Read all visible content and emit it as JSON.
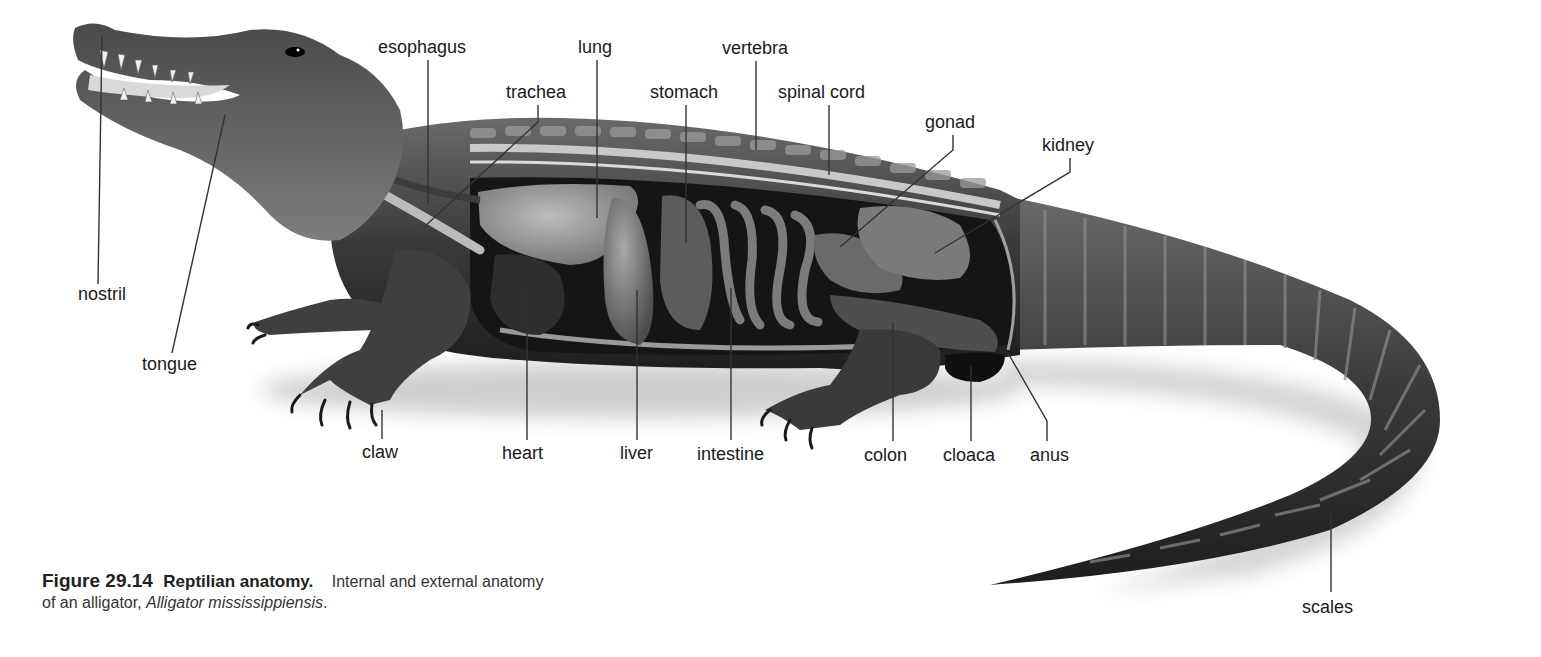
{
  "figure": {
    "number": "Figure 29.14",
    "title": "Reptilian anatomy.",
    "caption_text": "Internal and external anatomy",
    "caption_line2_prefix": "of an alligator, ",
    "species": "Alligator mississippiensis",
    "caption_line2_suffix": "."
  },
  "labels": [
    {
      "id": "nostril",
      "text": "nostril",
      "x": 78,
      "y": 284,
      "line": [
        [
          98,
          284
        ],
        [
          102,
          35
        ]
      ]
    },
    {
      "id": "tongue",
      "text": "tongue",
      "x": 142,
      "y": 354,
      "line": [
        [
          172,
          353
        ],
        [
          225,
          115
        ]
      ]
    },
    {
      "id": "esophagus",
      "text": "esophagus",
      "x": 378,
      "y": 37,
      "line": [
        [
          428,
          60
        ],
        [
          428,
          203
        ]
      ]
    },
    {
      "id": "trachea",
      "text": "trachea",
      "x": 506,
      "y": 82,
      "line": [
        [
          538,
          105
        ],
        [
          538,
          122
        ],
        [
          423,
          228
        ]
      ]
    },
    {
      "id": "lung",
      "text": "lung",
      "x": 578,
      "y": 37,
      "line": [
        [
          597,
          60
        ],
        [
          597,
          218
        ]
      ]
    },
    {
      "id": "stomach",
      "text": "stomach",
      "x": 650,
      "y": 82,
      "line": [
        [
          686,
          105
        ],
        [
          686,
          243
        ]
      ]
    },
    {
      "id": "vertebra",
      "text": "vertebra",
      "x": 722,
      "y": 38,
      "line": [
        [
          756,
          61
        ],
        [
          756,
          150
        ]
      ]
    },
    {
      "id": "spinal-cord",
      "text": "spinal cord",
      "x": 778,
      "y": 82,
      "line": [
        [
          829,
          105
        ],
        [
          829,
          175
        ]
      ]
    },
    {
      "id": "gonad",
      "text": "gonad",
      "x": 925,
      "y": 112,
      "line": [
        [
          953,
          135
        ],
        [
          953,
          150
        ],
        [
          840,
          247
        ]
      ]
    },
    {
      "id": "kidney",
      "text": "kidney",
      "x": 1042,
      "y": 135,
      "line": [
        [
          1070,
          158
        ],
        [
          1070,
          172
        ],
        [
          935,
          253
        ]
      ]
    },
    {
      "id": "heart",
      "text": "heart",
      "x": 502,
      "y": 443,
      "line": [
        [
          527,
          440
        ],
        [
          527,
          290
        ]
      ]
    },
    {
      "id": "liver",
      "text": "liver",
      "x": 620,
      "y": 443,
      "line": [
        [
          637,
          440
        ],
        [
          637,
          290
        ]
      ]
    },
    {
      "id": "intestine",
      "text": "intestine",
      "x": 697,
      "y": 444,
      "line": [
        [
          731,
          440
        ],
        [
          731,
          288
        ]
      ]
    },
    {
      "id": "claw",
      "text": "claw",
      "x": 362,
      "y": 442,
      "line": [
        [
          382,
          439
        ],
        [
          382,
          410
        ]
      ]
    },
    {
      "id": "colon",
      "text": "colon",
      "x": 864,
      "y": 445,
      "line": [
        [
          893,
          441
        ],
        [
          893,
          322
        ]
      ]
    },
    {
      "id": "cloaca",
      "text": "cloaca",
      "x": 943,
      "y": 445,
      "line": [
        [
          971,
          441
        ],
        [
          971,
          365
        ]
      ]
    },
    {
      "id": "anus",
      "text": "anus",
      "x": 1030,
      "y": 445,
      "line": [
        [
          1047,
          441
        ],
        [
          1047,
          421
        ],
        [
          1008,
          353
        ]
      ]
    },
    {
      "id": "scales",
      "text": "scales",
      "x": 1302,
      "y": 597,
      "line": [
        [
          1331,
          592
        ],
        [
          1331,
          512
        ]
      ]
    }
  ],
  "colors": {
    "background": "#ffffff",
    "label_text": "#1a1a1a",
    "leader_line": "#333333",
    "body_dark": "#2b2b2b",
    "body_mid": "#5a5a5a",
    "organ_light": "#8c8c8c",
    "cavity": "#151515"
  }
}
